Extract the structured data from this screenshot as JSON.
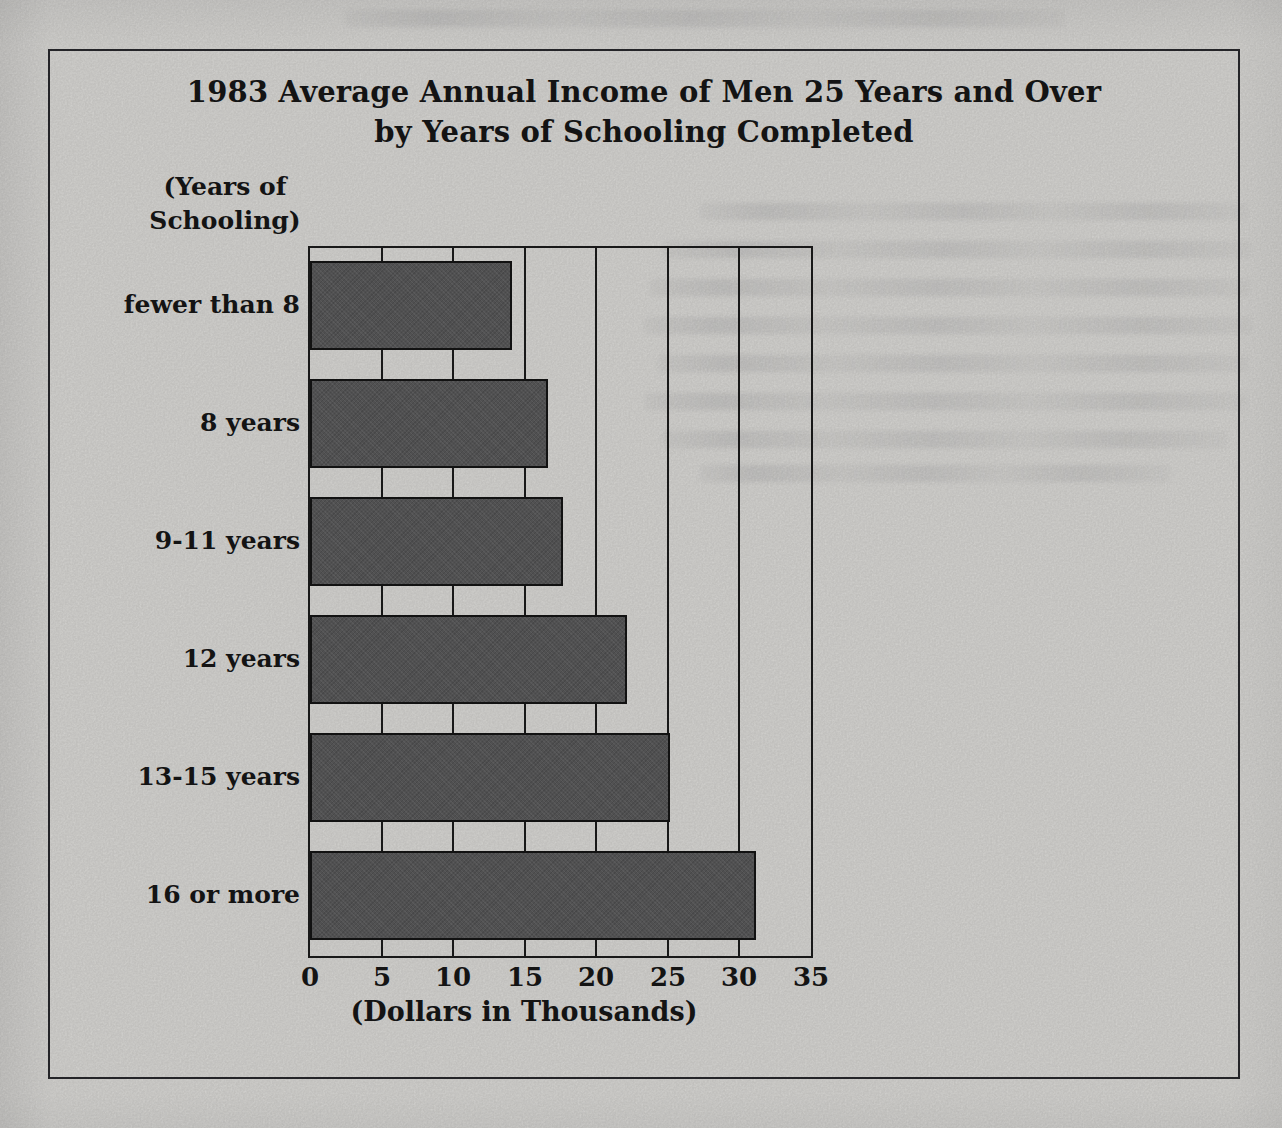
{
  "chart_box": {
    "title_lines": [
      "1983 Average Annual Income of Men 25 Years and Over",
      "by Years of Schooling Completed"
    ],
    "y_axis_unit_lines": [
      "(Years of",
      "Schooling)"
    ],
    "x_axis_label": "(Dollars in Thousands)"
  },
  "chart_data": {
    "type": "bar",
    "orientation": "horizontal",
    "title": "1983 Average Annual Income of Men 25 Years and Over by Years of Schooling Completed",
    "ylabel": "(Years of Schooling)",
    "xlabel": "(Dollars in Thousands)",
    "categories": [
      "fewer than 8",
      "8 years",
      "9-11 years",
      "12 years",
      "13-15 years",
      "16 or more"
    ],
    "values": [
      14,
      16.5,
      17.5,
      22,
      25,
      31
    ],
    "xlim": [
      0,
      35
    ],
    "x_ticks": [
      0,
      5,
      10,
      15,
      20,
      25,
      30,
      35
    ],
    "grid": true,
    "legend": "none",
    "colors": {
      "bar_fill": "#59595a",
      "bar_border": "#141414",
      "frame": "#1b1b1b",
      "paper": "#dad9d6",
      "text": "#161616"
    }
  }
}
